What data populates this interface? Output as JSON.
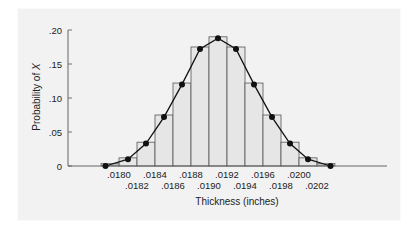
{
  "chart_data": {
    "type": "bar",
    "subtype": "histogram-with-frequency-polygon",
    "title": "",
    "xlabel": "Thickness (inches)",
    "ylabel": "Probability of X",
    "ylim": [
      0,
      0.2
    ],
    "yticks": [
      {
        "value": 0,
        "label": "0"
      },
      {
        "value": 0.05,
        "label": ".05"
      },
      {
        "value": 0.1,
        "label": ".10"
      },
      {
        "value": 0.15,
        "label": ".15"
      },
      {
        "value": 0.2,
        "label": ".20"
      }
    ],
    "xtick_labels_row1": [
      ".0180",
      ".0184",
      ".0188",
      ".0192",
      ".0196",
      ".0200"
    ],
    "xtick_labels_row2": [
      ".0182",
      ".0186",
      ".0190",
      ".0194",
      ".0198",
      ".0202"
    ],
    "categories": [
      ".0181",
      ".0182",
      ".0183",
      ".0184",
      ".0185",
      ".0186",
      ".0187",
      ".0188",
      ".0189",
      ".0190",
      ".0191",
      ".0192",
      ".0193",
      ".0194",
      ".0195",
      ".0196",
      ".0197",
      ".0198",
      ".0199",
      ".0200",
      ".0201"
    ],
    "bars": [
      {
        "x_center": 0.0181,
        "value": 0.005
      },
      {
        "x_center": 0.0182,
        "value": 0.012
      },
      {
        "x_center": 0.0183,
        "value": 0.035
      },
      {
        "x_center": 0.0184,
        "value": 0.075
      },
      {
        "x_center": 0.0185,
        "value": 0.122
      },
      {
        "x_center": 0.0186,
        "value": 0.175
      },
      {
        "x_center": 0.0187,
        "value": 0.19
      },
      {
        "x_center": 0.0188,
        "value": 0.175
      },
      {
        "x_center": 0.0189,
        "value": 0.122
      },
      {
        "x_center": 0.019,
        "value": 0.075
      },
      {
        "x_center": 0.0191,
        "value": 0.035
      },
      {
        "x_center": 0.0192,
        "value": 0.012
      },
      {
        "x_center": 0.0193,
        "value": 0.005
      }
    ],
    "polygon_points": [
      {
        "x": 0.01785,
        "y": 0
      },
      {
        "x": 0.0181,
        "y": 0.01
      },
      {
        "x": 0.0183,
        "y": 0.033
      },
      {
        "x": 0.0185,
        "y": 0.072
      },
      {
        "x": 0.0187,
        "y": 0.12
      },
      {
        "x": 0.0189,
        "y": 0.172
      },
      {
        "x": 0.0191,
        "y": 0.188
      },
      {
        "x": 0.0193,
        "y": 0.172
      },
      {
        "x": 0.0195,
        "y": 0.12
      },
      {
        "x": 0.0197,
        "y": 0.072
      },
      {
        "x": 0.0199,
        "y": 0.033
      },
      {
        "x": 0.0201,
        "y": 0.01
      },
      {
        "x": 0.02035,
        "y": 0
      }
    ],
    "grid": false,
    "legend": null
  },
  "layout": {
    "plot_left": 68,
    "plot_right": 387,
    "y_zero_px": 166,
    "px_per_unit_y": 680,
    "colors": {
      "bar_fill": "#e6e6e6",
      "bar_stroke": "#555555",
      "line": "#111111",
      "axis": "#555555",
      "panel": "#f2f2f2"
    }
  }
}
